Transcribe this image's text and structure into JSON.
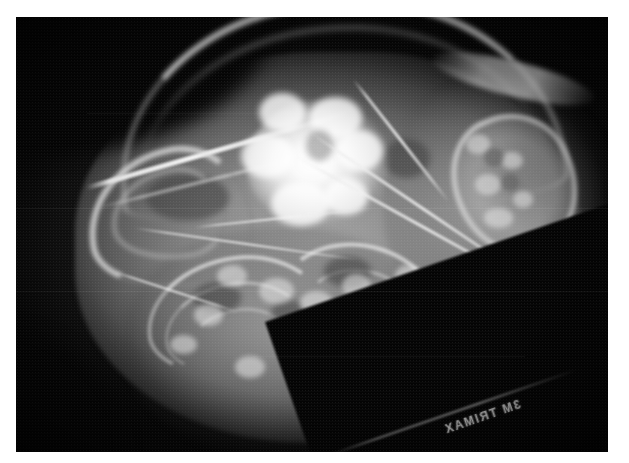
{
  "image": {
    "kind": "radiograph",
    "modality": "X-ray (plain film radiograph)",
    "view": "lateral skull",
    "orientation": "nose to left, occiput to right",
    "colorspace": "grayscale",
    "width_px": 629,
    "height_px": 463,
    "border": {
      "present": true,
      "color": "#ffffff",
      "left_px": 16,
      "top_px": 17,
      "right_px": 21,
      "bottom_px": 11
    },
    "background_color": "#050505",
    "brightest_color": "#ffffff",
    "midtone_color": "#9a9a9a"
  },
  "film_marking": {
    "label": "3M TRIMAX",
    "mirrored": true,
    "rotation_deg": -19,
    "position": "lower-right along diagonal cassette edge",
    "color": "#e2e2e2"
  },
  "features": [
    {
      "name": "cranial-vault-arch",
      "description": "Bright curved band forming the dorsal outline of the skull, sweeping from upper-left down to the right",
      "brightness": "high"
    },
    {
      "name": "zygomatic-arch-rod",
      "description": "Long thin bright linear bone running diagonally across the upper-left quadrant",
      "brightness": "very-high"
    },
    {
      "name": "pinna-curl",
      "description": "Hook-shaped curled radiopaque structure at the left margin",
      "brightness": "medium-high"
    },
    {
      "name": "calcified-mass",
      "description": "Large irregular lobulated markedly radiopaque mass in the central skull, the dominant abnormality",
      "brightness": "maximal"
    },
    {
      "name": "bony-block-right",
      "description": "Rectangular trabeculated bony structure on the right with mottled lucent cells",
      "brightness": "medium-high"
    },
    {
      "name": "dental-nasal-arcade",
      "description": "Nested curved arcs and small rounded opacities in the lower half representing teeth roots and turbinates",
      "brightness": "medium"
    },
    {
      "name": "hyoid-linear-streaks",
      "description": "Thin bright straight lines crossing the mid and lower-right field",
      "brightness": "high"
    },
    {
      "name": "soft-tissue-silhouette",
      "description": "Broad gray soft-tissue envelope surrounding the bone, fading to black background",
      "brightness": "low-medium"
    },
    {
      "name": "cassette-corner",
      "description": "Black diagonal unexposed corner at the lower right where the film edge cuts across",
      "brightness": "minimal"
    }
  ]
}
